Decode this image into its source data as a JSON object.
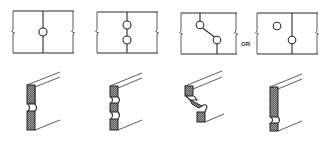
{
  "diagram": {
    "connector_label": "OR",
    "panels": [
      {
        "id": "single-pipe-centered",
        "plan_pipes": 1,
        "notches": 1
      },
      {
        "id": "two-pipes-stacked",
        "plan_pipes": 2,
        "notches": 2
      },
      {
        "id": "two-pipes-offset-diagonal",
        "plan_pipes": 2,
        "notches": 2
      },
      {
        "id": "two-pipes-one-in-stud",
        "plan_pipes": 2,
        "notches": 1
      }
    ],
    "colors": {
      "line": "#2a2a2a",
      "hatch": "#555555",
      "background": "#ffffff"
    }
  }
}
